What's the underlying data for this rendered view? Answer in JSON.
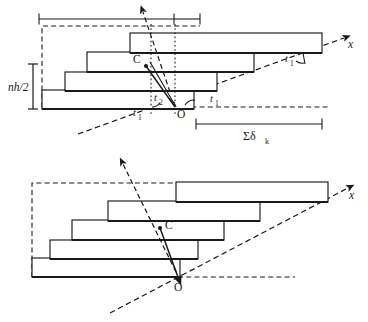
{
  "figure": {
    "type": "mechanics-diagram",
    "background": "#ffffff",
    "stroke_color": "#1a1a1a",
    "fill_color": "#ffffff",
    "panels": [
      {
        "id": "top-panel",
        "labels": {
          "height_dimension": "nh/2",
          "centroid": "C",
          "origin": "O",
          "axis_x": "x",
          "angle_t1_right": "t",
          "angle_t1_right_sub": "1",
          "angle_t1_inner": "t",
          "angle_t1_inner_sub": "1",
          "angle_t1_left": "t",
          "angle_t1_left_sub": "1",
          "angle_t2": "t",
          "angle_t2_sub": "2",
          "sum_delta": "Σδ",
          "sum_delta_sub": "k"
        },
        "bar_count": 4
      },
      {
        "id": "bottom-panel",
        "labels": {
          "centroid": "C",
          "origin": "O",
          "axis_x": "x"
        },
        "bar_count": 5
      }
    ]
  }
}
